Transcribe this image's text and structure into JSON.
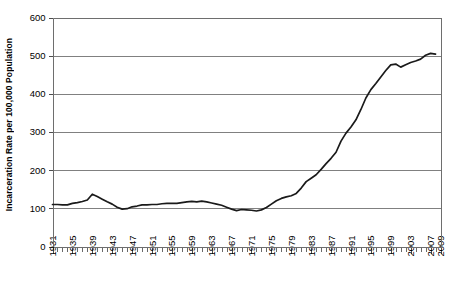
{
  "chart_data": {
    "type": "line",
    "title": "",
    "xlabel": "",
    "ylabel": "Incarceration Rate per 100,000 Population",
    "ylim": [
      0,
      600
    ],
    "xlim": [
      1931,
      2009
    ],
    "ytick_labels": [
      "0",
      "100",
      "200",
      "300",
      "400",
      "500",
      "600"
    ],
    "ytick_values": [
      0,
      100,
      200,
      300,
      400,
      500,
      600
    ],
    "xtick_labels": [
      "1931",
      "1935",
      "1939",
      "1943",
      "1947",
      "1951",
      "1955",
      "1959",
      "1963",
      "1967",
      "1971",
      "1975",
      "1979",
      "1983",
      "1987",
      "1991",
      "1995",
      "1999",
      "2003",
      "2007",
      "2009"
    ],
    "xtick_values": [
      1931,
      1935,
      1939,
      1943,
      1947,
      1951,
      1955,
      1959,
      1963,
      1967,
      1971,
      1975,
      1979,
      1983,
      1987,
      1991,
      1995,
      1999,
      2003,
      2007,
      2009
    ],
    "grid": "horizontal",
    "legend": "none",
    "minor_tick_interval": 1,
    "line_color": "#1a1a1a",
    "grid_color": "#808080",
    "axis_color": "#6e6e6e",
    "background_color": "#ffffff",
    "x": [
      1931,
      1932,
      1933,
      1934,
      1935,
      1936,
      1937,
      1938,
      1939,
      1940,
      1941,
      1942,
      1943,
      1944,
      1945,
      1946,
      1947,
      1948,
      1949,
      1950,
      1951,
      1952,
      1953,
      1954,
      1955,
      1956,
      1957,
      1958,
      1959,
      1960,
      1961,
      1962,
      1963,
      1964,
      1965,
      1966,
      1967,
      1968,
      1969,
      1970,
      1971,
      1972,
      1973,
      1974,
      1975,
      1976,
      1977,
      1978,
      1979,
      1980,
      1981,
      1982,
      1983,
      1984,
      1985,
      1986,
      1987,
      1988,
      1989,
      1990,
      1991,
      1992,
      1993,
      1994,
      1995,
      1996,
      1997,
      1998,
      1999,
      2000,
      2001,
      2002,
      2003,
      2004,
      2005,
      2006,
      2007,
      2008
    ],
    "values": [
      110,
      110,
      109,
      109,
      113,
      115,
      118,
      122,
      137,
      131,
      124,
      117,
      111,
      103,
      98,
      99,
      104,
      106,
      109,
      109,
      110,
      110,
      112,
      113,
      113,
      113,
      115,
      117,
      118,
      117,
      119,
      117,
      114,
      111,
      108,
      103,
      98,
      94,
      97,
      96,
      95,
      93,
      96,
      102,
      111,
      120,
      126,
      130,
      133,
      139,
      153,
      170,
      179,
      188,
      202,
      217,
      231,
      247,
      276,
      297,
      313,
      332,
      359,
      389,
      411,
      427,
      444,
      461,
      476,
      478,
      470,
      476,
      482,
      486,
      491,
      501,
      506,
      504
    ]
  }
}
